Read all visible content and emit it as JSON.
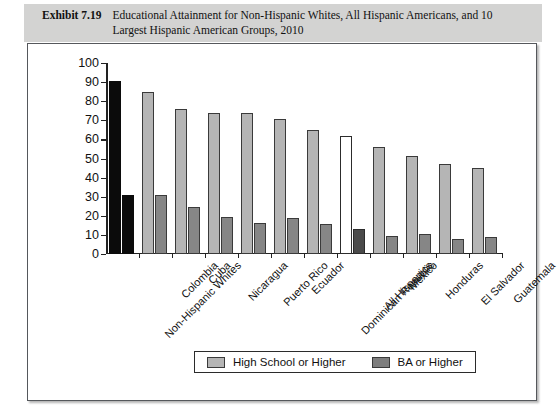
{
  "exhibit": {
    "label": "Exhibit 7.19",
    "title": "Educational Attainment for Non-Hispanic Whites, All Hispanic Americans, and 10 Largest Hispanic American Groups, 2010"
  },
  "legend": {
    "items": [
      {
        "label": "High School or Higher",
        "color": "#b5b5b5"
      },
      {
        "label": "BA or Higher",
        "color": "#7e7e7e"
      }
    ]
  },
  "chart_data": {
    "type": "bar",
    "title": "Educational Attainment for Non-Hispanic Whites, All Hispanic Americans, and 10 Largest Hispanic American Groups, 2010",
    "xlabel": "",
    "ylabel": "",
    "ylim": [
      0,
      100
    ],
    "yticks": [
      0,
      10,
      20,
      30,
      40,
      50,
      60,
      70,
      80,
      90,
      100
    ],
    "grid": false,
    "legend_position": "bottom",
    "categories": [
      "Non-Hispanic Whites",
      "Colombia",
      "Cuba",
      "Nicaragua",
      "Puerto Rico",
      "Ecuador",
      "Dominican Republic",
      "All Hispanics",
      "Mexico",
      "Honduras",
      "El Salvador",
      "Guatemala"
    ],
    "series": [
      {
        "name": "High School or Higher",
        "values": [
          90.5,
          85.0,
          76.0,
          74.0,
          74.0,
          70.5,
          64.8,
          62.0,
          56.0,
          51.3,
          47.0,
          45.0
        ]
      },
      {
        "name": "BA or Higher",
        "values": [
          31.0,
          31.0,
          24.5,
          19.2,
          16.0,
          18.6,
          15.5,
          13.2,
          9.5,
          10.3,
          7.8,
          9.0
        ]
      }
    ],
    "highlight_categories": [
      "Non-Hispanic Whites",
      "All Hispanics"
    ]
  }
}
